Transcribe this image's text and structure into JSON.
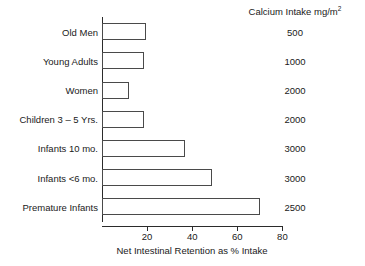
{
  "chart_data": {
    "type": "bar",
    "orientation": "horizontal",
    "title": "",
    "xlabel": "Net Intestinal Retention as % Intake",
    "ylabel": "",
    "xlim": [
      0,
      85
    ],
    "xticks": [
      20,
      40,
      60,
      80
    ],
    "xtick_labels": [
      "20",
      "40",
      "60",
      "80"
    ],
    "grid": false,
    "legend": null,
    "categories": [
      "Old Men",
      "Young Adults",
      "Women",
      "Children 3 – 5 Yrs.",
      "Infants 10 mo.",
      "Infants <6 mo.",
      "Premature Infants"
    ],
    "values": [
      19.5,
      18.5,
      12,
      18.5,
      37,
      49,
      70
    ],
    "series": [
      {
        "name": "Net Intestinal Retention as % Intake",
        "values": [
          19.5,
          18.5,
          12,
          18.5,
          37,
          49,
          70
        ]
      }
    ],
    "annotation_column": {
      "header": "Calcium Intake mg/m",
      "header_superscript": "2",
      "values": [
        "500",
        "1000",
        "2000",
        "2000",
        "3000",
        "3000",
        "2500"
      ]
    },
    "colors": {
      "bar_fill": "#ffffff",
      "bar_stroke": "#4a4a4a",
      "axis": "#2b2b2b",
      "text": "#1a1a1a"
    }
  }
}
